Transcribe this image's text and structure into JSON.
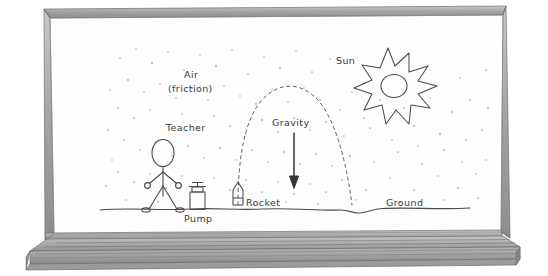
{
  "scene": {
    "title": "Whiteboard bottle-rocket physics diagram",
    "surface": "whiteboard",
    "board_fill": "#fdfdfd",
    "frame_color": "#9a9a9a",
    "tray_color": "#b0b0b0",
    "ink_color": "#444444",
    "stipple_color": "#9e9e9e",
    "background": "#ffffff"
  },
  "labels": {
    "air": "Air",
    "air_sub": "(friction)",
    "teacher": "Teacher",
    "pump": "Pump",
    "rocket": "Rocket",
    "gravity": "Gravity",
    "sun": "Sun",
    "ground": "Ground"
  },
  "figures": {
    "teacher": {
      "name": "stick-figure-teacher"
    },
    "pump": {
      "name": "bicycle-pump"
    },
    "rocket": {
      "name": "bottle-rocket"
    },
    "sun": {
      "name": "sun-star"
    },
    "gravity_arrow": {
      "name": "downward-arrow"
    },
    "trajectory": {
      "name": "dashed-parabolic-arc"
    },
    "ground_line": {
      "name": "wavy-ground-line"
    },
    "air_stipple": {
      "name": "stipple-dots"
    }
  }
}
